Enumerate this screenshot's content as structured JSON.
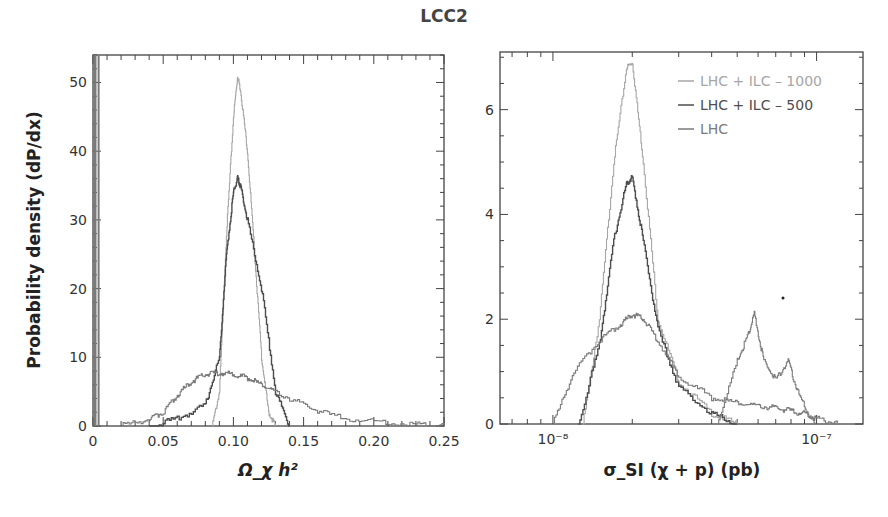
{
  "title": "LCC2",
  "colors": {
    "lhc_ilc_1000": "#a6a6a6",
    "lhc_ilc_500": "#4d4d4d",
    "lhc": "#7a7a7a",
    "axis": "#444444"
  },
  "chart_data": [
    {
      "type": "line",
      "panel": "left",
      "title": "LCC2",
      "xlabel": "Ω_χ h²",
      "ylabel": "Probability density (dP/dx)",
      "xlim": [
        0,
        0.25
      ],
      "ylim": [
        0,
        54
      ],
      "xticks": [
        0,
        0.05,
        0.1,
        0.15,
        0.2,
        0.25
      ],
      "xtick_labels": [
        "0",
        "0.05",
        "0.10",
        "0.15",
        "0.20",
        "0.25"
      ],
      "yticks": [
        0,
        10,
        20,
        30,
        40,
        50
      ],
      "ytick_labels": [
        "0",
        "10",
        "20",
        "30",
        "40",
        "50"
      ],
      "series": [
        {
          "name": "LHC + ILC – 1000",
          "x": [
            0.085,
            0.09,
            0.095,
            0.1,
            0.103,
            0.105,
            0.11,
            0.115,
            0.12,
            0.125,
            0.13
          ],
          "y": [
            0,
            5,
            28,
            45,
            51,
            49,
            40,
            25,
            10,
            2,
            0
          ]
        },
        {
          "name": "LHC + ILC – 500",
          "x": [
            0.04,
            0.06,
            0.08,
            0.09,
            0.095,
            0.1,
            0.103,
            0.105,
            0.11,
            0.12,
            0.13,
            0.14
          ],
          "y": [
            0,
            1,
            3,
            10,
            25,
            34,
            36,
            35,
            30,
            20,
            5,
            0
          ]
        },
        {
          "name": "LHC",
          "x": [
            0.02,
            0.04,
            0.05,
            0.06,
            0.07,
            0.08,
            0.09,
            0.1,
            0.11,
            0.12,
            0.13,
            0.15,
            0.17,
            0.2,
            0.23,
            0.25
          ],
          "y": [
            0,
            1,
            2,
            4.5,
            6.5,
            7.5,
            7.8,
            7.5,
            7,
            6,
            5,
            3,
            1.5,
            0.6,
            0.2,
            0.1
          ]
        }
      ],
      "annotations": [
        "spike near x≈0.005 reaching top of axis"
      ]
    },
    {
      "type": "line",
      "panel": "right",
      "xlabel": "σ_SI (χ + p) (pb)",
      "ylabel": "",
      "xscale": "log",
      "xlim": [
        6.3e-09,
        1.5e-07
      ],
      "ylim": [
        0,
        7.1
      ],
      "xtick_labels": [
        "10⁻⁸",
        "10⁻⁷"
      ],
      "yticks": [
        0,
        2,
        4,
        6
      ],
      "ytick_labels": [
        "0",
        "2",
        "4",
        "6"
      ],
      "legend": [
        "LHC + ILC – 1000",
        "LHC + ILC – 500",
        "LHC"
      ],
      "legend_position": "upper right",
      "series": [
        {
          "name": "LHC + ILC – 1000",
          "x": [
            1.3e-08,
            1.5e-08,
            1.7e-08,
            1.9e-08,
            2e-08,
            2.2e-08,
            2.5e-08,
            3e-08,
            4e-08,
            5e-08
          ],
          "y": [
            0,
            2,
            5,
            6.8,
            6.9,
            5,
            2,
            0.8,
            0.2,
            0
          ]
        },
        {
          "name": "LHC + ILC – 500",
          "x": [
            1.25e-08,
            1.5e-08,
            1.7e-08,
            1.9e-08,
            2e-08,
            2.2e-08,
            2.5e-08,
            3e-08,
            4e-08,
            5e-08
          ],
          "y": [
            0,
            1.5,
            3.5,
            4.6,
            4.7,
            3.5,
            1.8,
            0.7,
            0.2,
            0
          ]
        },
        {
          "name": "LHC",
          "x": [
            1e-08,
            1.2e-08,
            1.5e-08,
            1.8e-08,
            2e-08,
            2.2e-08,
            2.5e-08,
            3e-08,
            4e-08,
            5e-08,
            6e-08,
            7e-08,
            8e-08,
            9e-08,
            1e-07,
            1.2e-07
          ],
          "y": [
            0,
            1,
            1.6,
            1.9,
            2.1,
            2.0,
            1.6,
            0.9,
            0.5,
            0.4,
            0.35,
            0.3,
            0.25,
            0.2,
            0.1,
            0.02
          ]
        },
        {
          "name": "LHC (second bump)",
          "x": [
            4.2e-08,
            5e-08,
            5.5e-08,
            5.8e-08,
            6.3e-08,
            7e-08,
            7.8e-08,
            8.5e-08,
            9.5e-08,
            1e-07
          ],
          "y": [
            0,
            1.2,
            1.7,
            2.1,
            1.2,
            0.85,
            1.2,
            0.6,
            0.1,
            0
          ]
        }
      ]
    }
  ]
}
